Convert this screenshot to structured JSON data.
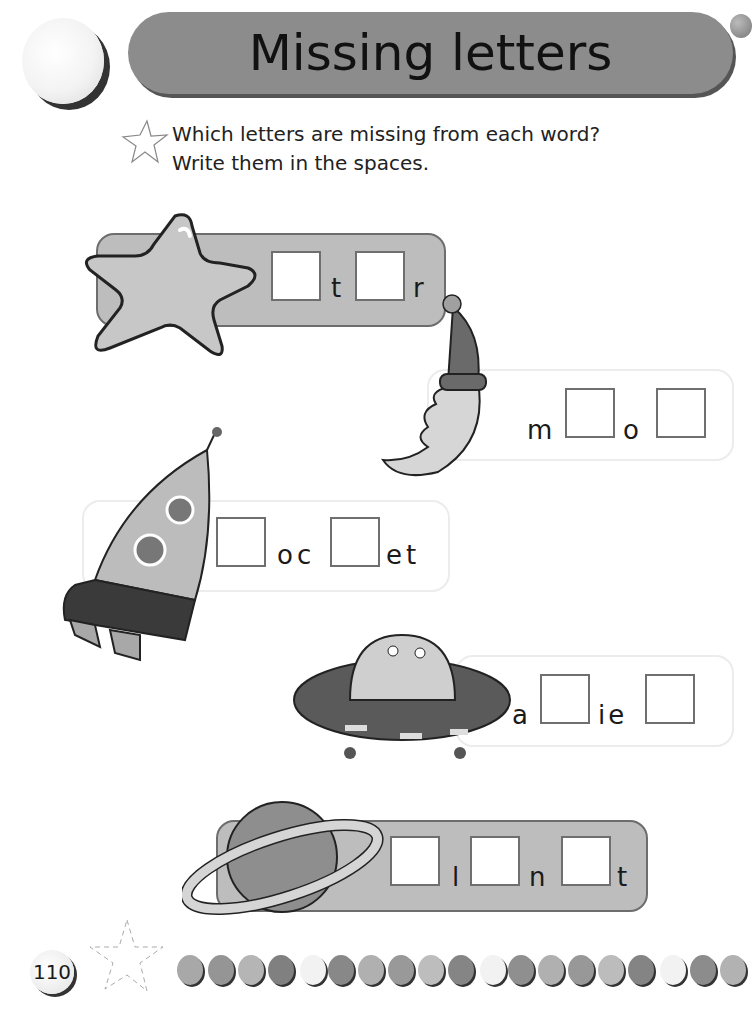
{
  "header": {
    "title": "Missing letters"
  },
  "instructions": {
    "line1": "Which letters are missing from each word?",
    "line2": "Write them in the spaces.",
    "icon": "star-outline-icon"
  },
  "exercises": [
    {
      "picture": "star",
      "word_parts": [
        "",
        "t",
        "",
        "r"
      ],
      "letters": {
        "l1": "t",
        "l2": "r"
      },
      "blanks": 2
    },
    {
      "picture": "moon-with-nightcap",
      "letters": {
        "l1": "m",
        "l2": "o"
      },
      "word_parts": [
        "m",
        "",
        "o",
        ""
      ],
      "blanks": 2
    },
    {
      "picture": "rocket",
      "letters": {
        "l1": "oc",
        "l2": "et"
      },
      "word_parts": [
        "",
        "oc",
        "",
        "et"
      ],
      "blanks": 2
    },
    {
      "picture": "alien-spaceship",
      "letters": {
        "l1": "a",
        "l2": "ie"
      },
      "word_parts": [
        "a",
        "",
        "ie",
        ""
      ],
      "blanks": 2
    },
    {
      "picture": "planet",
      "letters": {
        "l1": "l",
        "l2": "n",
        "l3": "t"
      },
      "word_parts": [
        "",
        "l",
        "",
        "n",
        "",
        "t"
      ],
      "blanks": 3
    }
  ],
  "footer": {
    "page_number": "110"
  },
  "colors": {
    "banner": "#8c8c8c",
    "bar_dark": "#bdbdbd",
    "box_border": "#6f6f6f"
  }
}
